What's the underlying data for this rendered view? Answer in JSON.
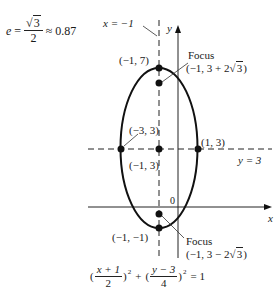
{
  "eccentricity": {
    "symbol": "e",
    "equals": "=",
    "numerator_radicand": "3",
    "denominator": "2",
    "approx": "≈ 0.87"
  },
  "axes": {
    "x_label": "x",
    "y_label": "y",
    "origin_label": "0"
  },
  "lines": {
    "directrix_label": "x = −1",
    "horizontal_label": "y = 3"
  },
  "points": {
    "top_vertex": "(−1, 7)",
    "center": "(−1, 3)",
    "left_vertex": "(−3, 3)",
    "right_vertex": "(1, 3)",
    "bottom_vertex": "(−1, −1)"
  },
  "foci": {
    "upper": {
      "title": "Focus",
      "coords_prefix": "(−1, 3 + 2",
      "radicand": "3",
      "coords_suffix": ")"
    },
    "lower": {
      "title": "Focus",
      "coords_prefix": "(−1, 3 − 2",
      "radicand": "3",
      "coords_suffix": ")"
    }
  },
  "equation": {
    "open1": "(",
    "num1": "x + 1",
    "den1": "2",
    "close1": ")",
    "exp1": "2",
    "plus": "+",
    "open2": "(",
    "num2": "y − 3",
    "den2": "4",
    "close2": ")",
    "exp2": "2",
    "rhs": "= 1"
  },
  "colors": {
    "stroke": "#111111",
    "background": "#ffffff"
  }
}
